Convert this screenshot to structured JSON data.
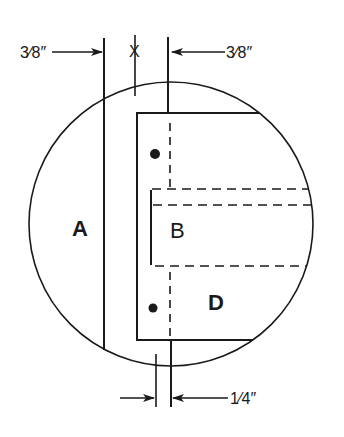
{
  "diagram": {
    "type": "technical-detail-drawing",
    "labels": {
      "a": "A",
      "b": "B",
      "d": "D",
      "x": "X"
    },
    "dimensions": {
      "top_left": "3⁄8″",
      "top_right": "3⁄8″",
      "bottom": "1⁄4″"
    },
    "colors": {
      "ink": "#1a1a1a",
      "background": "#ffffff"
    }
  }
}
